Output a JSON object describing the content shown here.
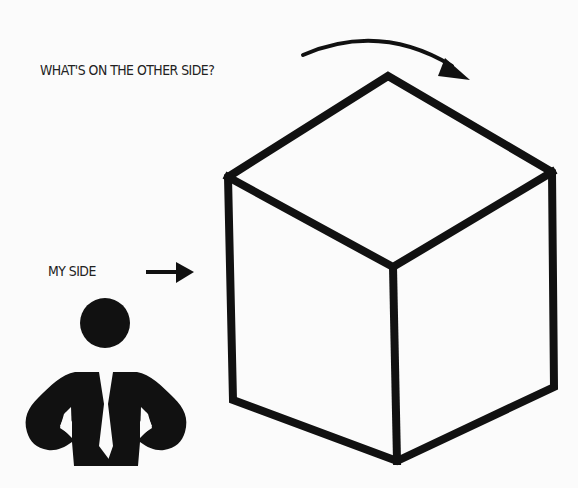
{
  "diagram": {
    "labels": {
      "other_side": "WHAT'S ON THE OTHER SIDE?",
      "my_side": "MY SIDE"
    },
    "elements": {
      "cube": "isometric-cube-outline",
      "person": "businessman-silhouette-hands-on-hips",
      "curved_arrow": "arrow-over-cube-to-other-side",
      "straight_arrow": "arrow-pointing-to-cube-front"
    },
    "colors": {
      "ink": "#111111",
      "background": "#fbfbfb",
      "text": "#222222"
    }
  }
}
